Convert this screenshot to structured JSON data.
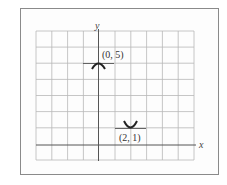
{
  "diagram": {
    "type": "coordinate-grid",
    "axes": {
      "x_label": "x",
      "y_label": "y"
    },
    "grid": {
      "columns": 10,
      "rows": 8,
      "x_range": [
        -4,
        6
      ],
      "y_range": [
        -1,
        7
      ]
    },
    "points": [
      {
        "label": "(0, 5)",
        "x": 0,
        "y": 5,
        "shape": "parabola-vertex-min",
        "opens": "down"
      },
      {
        "label": "(2, 1)",
        "x": 2,
        "y": 1,
        "shape": "parabola-vertex-max",
        "opens": "up"
      }
    ],
    "colors": {
      "grid": "#b8b8b8",
      "axis": "#555555",
      "mark": "#333333",
      "frame": "#8a8a8a"
    }
  }
}
